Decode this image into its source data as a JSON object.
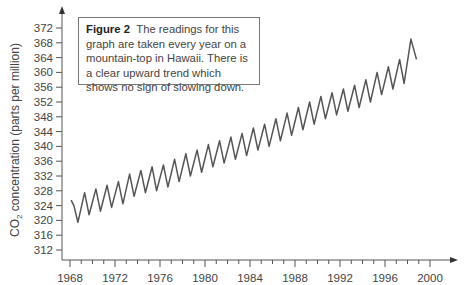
{
  "figure": {
    "caption_label": "Figure 2",
    "caption_text": "The readings for this graph are taken every year on a mountain-top in Hawaii. There is a clear upward trend which shows no sign of slowing down."
  },
  "axes": {
    "ylabel_prefix": "CO",
    "ylabel_sub": "2",
    "ylabel_suffix": " concentration (parts per million)"
  },
  "chart_data": {
    "type": "line",
    "title": "Figure 2",
    "subtitle": "The readings for this graph are taken every year on a mountain-top in Hawaii. There is a clear upward trend which shows no sign of slowing down.",
    "xlabel": "",
    "ylabel": "CO2 concentration (parts per million)",
    "xlim": [
      1967.5,
      2001
    ],
    "ylim": [
      310,
      374
    ],
    "xticks": [
      1968,
      1972,
      1976,
      1980,
      1984,
      1988,
      1992,
      1996,
      2000
    ],
    "yticks": [
      312,
      316,
      320,
      324,
      328,
      332,
      336,
      340,
      344,
      348,
      352,
      356,
      360,
      364,
      368,
      372
    ],
    "grid": false,
    "legend": null,
    "series": [
      {
        "name": "CO2 concentration",
        "x": [
          1968.1,
          1968.35,
          1968.7,
          1969.3,
          1969.7,
          1970.3,
          1970.7,
          1971.3,
          1971.7,
          1972.3,
          1972.7,
          1973.3,
          1973.7,
          1974.3,
          1974.7,
          1975.3,
          1975.7,
          1976.3,
          1976.7,
          1977.3,
          1977.7,
          1978.3,
          1978.7,
          1979.3,
          1979.7,
          1980.3,
          1980.7,
          1981.3,
          1981.7,
          1982.3,
          1982.7,
          1983.3,
          1983.7,
          1984.3,
          1984.7,
          1985.3,
          1985.7,
          1986.3,
          1986.7,
          1987.3,
          1987.7,
          1988.3,
          1988.7,
          1989.3,
          1989.7,
          1990.3,
          1990.7,
          1991.3,
          1991.7,
          1992.3,
          1992.7,
          1993.3,
          1993.7,
          1994.3,
          1994.7,
          1995.3,
          1995.7,
          1996.3,
          1996.7,
          1997.3,
          1997.7,
          1998.3,
          1998.8
        ],
        "values": [
          325.5,
          324.0,
          319.5,
          327.5,
          321.5,
          328.5,
          322.5,
          329.5,
          323.5,
          330.5,
          324.5,
          332.5,
          326.5,
          333.5,
          327.5,
          334.5,
          328.0,
          335.0,
          329.0,
          336.5,
          330.5,
          338.0,
          332.0,
          339.0,
          333.0,
          340.5,
          334.5,
          341.5,
          335.5,
          342.5,
          336.5,
          343.5,
          337.5,
          345.0,
          339.0,
          346.0,
          340.0,
          347.5,
          341.5,
          349.0,
          343.0,
          350.5,
          344.5,
          352.0,
          346.0,
          353.5,
          347.5,
          354.5,
          348.5,
          355.5,
          349.5,
          356.5,
          350.5,
          358.0,
          352.0,
          360.0,
          354.0,
          361.5,
          355.5,
          363.5,
          357.0,
          369.0,
          363.5
        ]
      }
    ]
  }
}
